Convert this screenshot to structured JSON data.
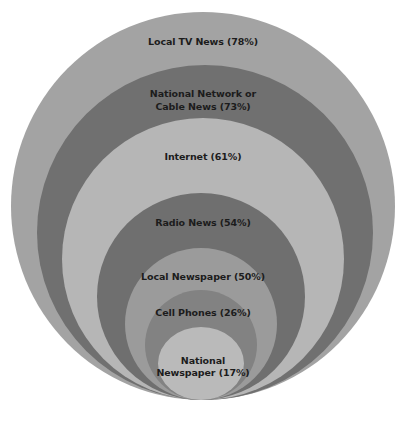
{
  "diagram": {
    "type": "nested-circles",
    "rings": [
      {
        "label": "Local TV News (78%)",
        "name": "Local TV News",
        "value": 78,
        "color": "#a3a3a3"
      },
      {
        "label_line1": "National Network or",
        "label_line2": "Cable News (73%)",
        "name": "National Network or Cable News",
        "value": 73,
        "color": "#707070"
      },
      {
        "label": "Internet (61%)",
        "name": "Internet",
        "value": 61,
        "color": "#b6b6b6"
      },
      {
        "label": "Radio News (54%)",
        "name": "Radio News",
        "value": 54,
        "color": "#6f6f6f"
      },
      {
        "label": "Local Newspaper (50%)",
        "name": "Local Newspaper",
        "value": 50,
        "color": "#9b9b9b"
      },
      {
        "label": "Cell Phones (26%)",
        "name": "Cell Phones",
        "value": 26,
        "color": "#828282"
      },
      {
        "label_line1": "National",
        "label_line2": "Newspaper (17%)",
        "name": "National Newspaper",
        "value": 17,
        "color": "#bababa"
      }
    ]
  }
}
